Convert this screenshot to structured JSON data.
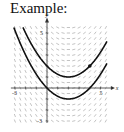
{
  "title": "Example:",
  "chart_data": {
    "type": "slope-field",
    "differential_equation": "dy/dx = (x - 2)/2",
    "xlabel": "x",
    "ylabel": "y",
    "xlim": [
      -3,
      5.5
    ],
    "ylim": [
      -3,
      5.5
    ],
    "x_tick_labels": [
      {
        "value": -3,
        "label": "-3"
      },
      {
        "value": 5,
        "label": "5"
      }
    ],
    "y_tick_labels": [
      {
        "value": 5,
        "label": "5"
      },
      {
        "value": -3,
        "label": "-3"
      }
    ],
    "field_step": 0.5,
    "solution_curves": [
      {
        "name": "upper-solution",
        "equation": "y = (x-2)^2/4 + 1"
      },
      {
        "name": "lower-solution",
        "equation": "y = (x-2)^2/4 - 1"
      }
    ],
    "marked_point": {
      "x": 4,
      "y": 2
    },
    "colors": {
      "field": "#9a9a9a",
      "curve": "#111111",
      "axis": "#333333"
    }
  }
}
